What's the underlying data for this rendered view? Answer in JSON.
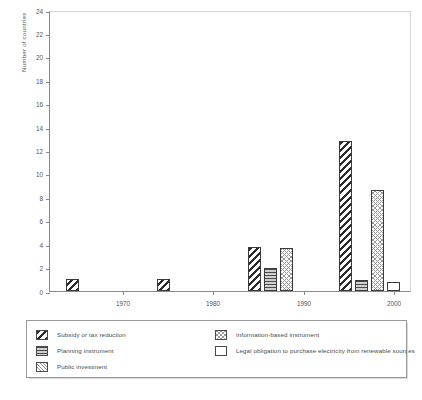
{
  "chart_data": {
    "type": "bar",
    "title": "",
    "xlabel": "",
    "ylabel": "Number of countries",
    "categories": [
      "1970",
      "1980",
      "1990",
      "2000"
    ],
    "ylim": [
      0,
      24
    ],
    "y_ticks": [
      0,
      2,
      4,
      6,
      8,
      10,
      12,
      14,
      16,
      18,
      20,
      22,
      24
    ],
    "grid": false,
    "legend_position": "below-plot",
    "series": [
      {
        "name": "Subsidy or tax reduction",
        "pattern": "diagonal-thick",
        "values": [
          1,
          1,
          3.8,
          12.8
        ]
      },
      {
        "name": "Planning instrument",
        "pattern": "horizontal-lines",
        "values": [
          0,
          0,
          2,
          0.9
        ]
      },
      {
        "name": "Public investment",
        "pattern": "diagonal-fine",
        "values": [
          0,
          0,
          0,
          0
        ]
      },
      {
        "name": "Information-based instrument",
        "pattern": "cross-hatch",
        "values": [
          0,
          0,
          3.7,
          8.6
        ]
      },
      {
        "name": "Legal obligation to purchase electricity from renewable sources",
        "pattern": "dots",
        "values": [
          0,
          0,
          0,
          0.8
        ]
      }
    ]
  },
  "axes": {
    "y_title": "Number of countries",
    "y_tick_labels": [
      "0",
      "2",
      "4",
      "6",
      "8",
      "10",
      "12",
      "14",
      "16",
      "18",
      "20",
      "22",
      "24"
    ],
    "x_tick_labels": [
      "1970",
      "1980",
      "1990",
      "2000"
    ]
  },
  "legend": {
    "left_column": [
      {
        "label": "Subsidy or tax reduction",
        "pattern": "diagonal-thick"
      },
      {
        "label": "Planning instrument",
        "pattern": "horizontal-lines"
      },
      {
        "label": "Public investment",
        "pattern": "diagonal-fine"
      }
    ],
    "right_column": [
      {
        "label": "Information-based instrument",
        "pattern": "cross-hatch"
      },
      {
        "label": "Legal obligation to purchase electricity from renewable sources",
        "pattern": "dots"
      }
    ]
  },
  "caption": ""
}
